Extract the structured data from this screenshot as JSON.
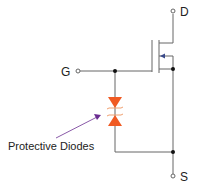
{
  "diagram": {
    "terminals": {
      "drain": "D",
      "gate": "G",
      "source": "S"
    },
    "annotation": "Protective Diodes",
    "colors": {
      "wire": "#555555",
      "diode": "#f05a22",
      "arrow": "#6a2c91",
      "junction": "#111111"
    }
  }
}
